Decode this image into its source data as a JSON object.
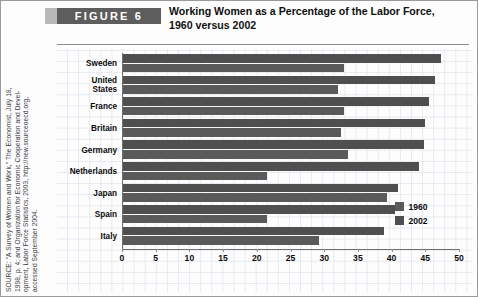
{
  "figure": {
    "badge_label": "FIGURE  6",
    "title_line1": "Working Women as a Percentage of the Labor Force,",
    "title_line2": "1960 versus 2002"
  },
  "source": {
    "text": "SOURCE: \"A Survey of Women and Work,\" The Economist, July 18, 1998, p. 4; and Organization for Economic Cooperation and Development, Labor Force Statistics, 2003, http://new.sourceoecd.org, accessed September 2004.",
    "line1": "SOURCE: \"A Survey of Women and Work,\" The Economist, July 18,",
    "line2": "1998, p. 4; and Organization for Economic Cooperation and Devel-",
    "line3": "opment, Labor Force Statistics, 2003, http://new.sourceoecd.org,",
    "line4": "accessed September 2004."
  },
  "colors": {
    "badge_bg": "#5d5d5d",
    "badge_lead": "#b9b9b9",
    "bar_1960": "#5a5a5a",
    "bar_2002": "#4f4f4f",
    "grid": "#e2e6ee",
    "axis": "#6f6f6f"
  },
  "legend": {
    "position": "bottom-right",
    "items": [
      {
        "label": "1960",
        "color": "#5a5a5a"
      },
      {
        "label": "2002",
        "color": "#4f4f4f"
      }
    ]
  },
  "axis": {
    "ticks": [
      0,
      5,
      10,
      15,
      20,
      25,
      30,
      35,
      40,
      45,
      50
    ],
    "tick_labels": [
      "0",
      "5",
      "10",
      "15",
      "20",
      "25",
      "30",
      "35",
      "40",
      "45",
      "50"
    ]
  },
  "chart_data": {
    "type": "bar",
    "orientation": "horizontal",
    "title": "Working Women as a Percentage of the Labor Force, 1960 versus 2002",
    "xlabel": "",
    "ylabel": "",
    "xlim": [
      0,
      50
    ],
    "grid": true,
    "legend_position": "bottom-right",
    "categories": [
      "Sweden",
      "United\nStates",
      "France",
      "Britain",
      "Germany",
      "Netherlands",
      "Japan",
      "Spain",
      "Italy"
    ],
    "category_labels": [
      "Sweden",
      "United States",
      "France",
      "Britain",
      "Germany",
      "Netherlands",
      "Japan",
      "Spain",
      "Italy"
    ],
    "series": [
      {
        "name": "1960",
        "color": "#5a5a5a",
        "values": [
          33.0,
          32.0,
          33.0,
          32.5,
          33.5,
          21.5,
          39.3,
          21.5,
          29.3
        ]
      },
      {
        "name": "2002",
        "color": "#4f4f4f",
        "values": [
          47.3,
          46.5,
          45.5,
          45.0,
          44.8,
          44.0,
          41.0,
          40.5,
          38.8
        ]
      }
    ]
  }
}
